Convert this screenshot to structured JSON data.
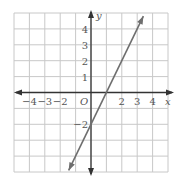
{
  "chart_data": {
    "type": "line",
    "title": "",
    "xlabel": "x",
    "ylabel": "y",
    "origin_label": "O",
    "xlim": [
      -5,
      5
    ],
    "ylim": [
      -5,
      5
    ],
    "grid": true,
    "x_tick_labels": [
      {
        "value": -4,
        "label": "−4"
      },
      {
        "value": -3,
        "label": "−3"
      },
      {
        "value": -2,
        "label": "−2"
      },
      {
        "value": 2,
        "label": "2"
      },
      {
        "value": 3,
        "label": "3"
      },
      {
        "value": 4,
        "label": "4"
      }
    ],
    "y_tick_labels": [
      {
        "value": 4,
        "label": "4"
      },
      {
        "value": 3,
        "label": "3"
      },
      {
        "value": 2,
        "label": "2"
      },
      {
        "value": 1,
        "label": "1"
      },
      {
        "value": -2,
        "label": "−2"
      }
    ],
    "series": [
      {
        "name": "y = 2x − 2",
        "slope": 2,
        "intercept": -2,
        "x": [
          -1.45,
          0,
          1,
          2,
          3,
          3.4
        ],
        "y": [
          -4.9,
          -2,
          0,
          2,
          4,
          4.8
        ],
        "arrows_both_ends": true
      }
    ],
    "colors": {
      "grid": "#c8c8c8",
      "axis": "#333333",
      "line": "#6e6e6e",
      "text": "#555555"
    }
  }
}
